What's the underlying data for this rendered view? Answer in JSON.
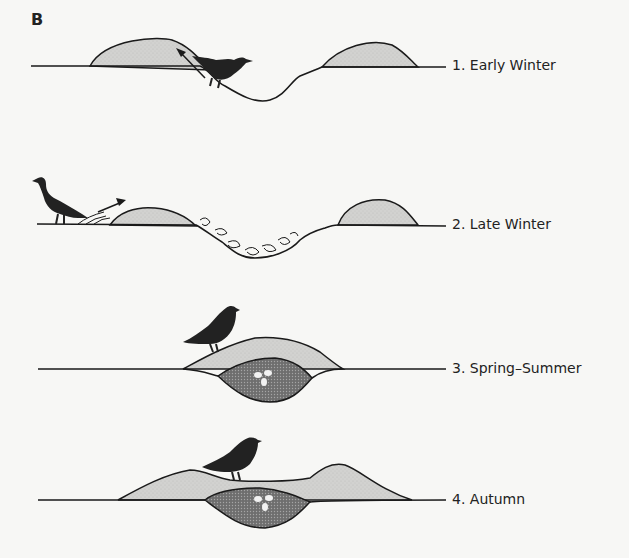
{
  "panel_letter": "B",
  "stages": [
    {
      "label": "1. Early Winter"
    },
    {
      "label": "2. Late Winter"
    },
    {
      "label": "3. Spring–Summer"
    },
    {
      "label": "4. Autumn"
    }
  ],
  "colors": {
    "background": "#f7f7f5",
    "mound_fill": "#cfcfcd",
    "compost_fill": "#777777",
    "line": "#1a1a1a",
    "bird": "#222222",
    "egg": "#f2f2f2"
  }
}
